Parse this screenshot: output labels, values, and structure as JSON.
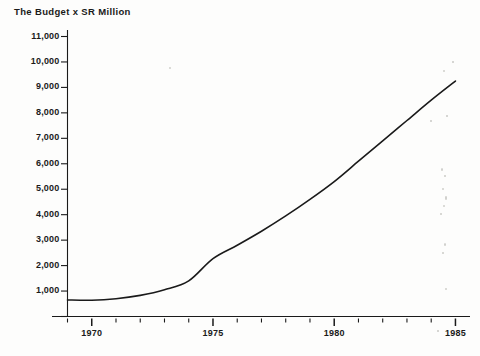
{
  "chart_data": {
    "type": "line",
    "title": "The Budget x SR Million",
    "xlabel": "",
    "ylabel": "",
    "xlim": [
      1969,
      1985.6
    ],
    "ylim": [
      0,
      11500
    ],
    "grid": false,
    "legend": null,
    "y_ticks": [
      1000,
      2000,
      3000,
      4000,
      5000,
      6000,
      7000,
      8000,
      9000,
      10000,
      11000
    ],
    "y_tick_labels": [
      "1,000",
      "2,000",
      "3,000",
      "4,000",
      "5,000",
      "6,000",
      "7,000",
      "8,000",
      "9,000",
      "10,000",
      "11,000"
    ],
    "y_minor_tick_at_zero": true,
    "x_major_ticks": [
      1970,
      1975,
      1980,
      1985
    ],
    "x_major_tick_labels": [
      "1970",
      "1975",
      "1980",
      "1985"
    ],
    "x_minor_ticks": [
      1969,
      1971,
      1972,
      1973,
      1974,
      1976,
      1977,
      1978,
      1979,
      1981,
      1982,
      1983,
      1984
    ],
    "series": [
      {
        "name": "Budget",
        "x": [
          1969,
          1970,
          1971,
          1972,
          1973,
          1974,
          1975,
          1976,
          1977,
          1978,
          1979,
          1980,
          1981,
          1982,
          1983,
          1984,
          1985
        ],
        "values": [
          650,
          640,
          700,
          830,
          1050,
          1400,
          2275,
          2800,
          3350,
          3950,
          4600,
          5300,
          6100,
          6900,
          7700,
          8500,
          9250
        ]
      }
    ]
  },
  "axis_labels": {
    "y": [
      "11,000",
      "10,000",
      "9,000",
      "8,000",
      "7,000",
      "6,000",
      "5,000",
      "4,000",
      "3,000",
      "2,000",
      "1,000"
    ],
    "x": [
      "1970",
      "1975",
      "1980",
      "1985"
    ]
  },
  "colors": {
    "background": "#fdfdfc",
    "axis": "#1a1a1a",
    "line": "#1a1a1a",
    "text": "#1a1a1a"
  }
}
